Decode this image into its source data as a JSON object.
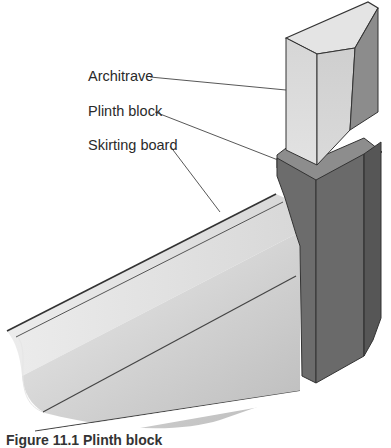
{
  "figure": {
    "caption": "Figure 11.1 Plinth block",
    "labels": [
      {
        "id": "architrave",
        "text": "Architrave"
      },
      {
        "id": "plinth-block",
        "text": "Plinth block"
      },
      {
        "id": "skirting-board",
        "text": "Skirting board"
      }
    ],
    "colors": {
      "background": "#ffffff",
      "architrave_light": "#d9d9d9",
      "architrave_top": "#e4e4e4",
      "architrave_dark": "#8a8a8a",
      "plinth_front": "#6f6f6f",
      "plinth_side": "#5e5e5e",
      "skirting_light": "#e2e2e2",
      "skirting_shadow": "#c4c4c4",
      "outline": "#333333",
      "leader_line": "#444444"
    }
  }
}
